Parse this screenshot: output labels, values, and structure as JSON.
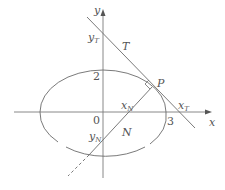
{
  "diagram": {
    "type": "ellipse-tangent-normal",
    "axes": {
      "x_label": "x",
      "y_label": "y"
    },
    "ticks": {
      "origin": "0",
      "x_intercept": "3",
      "y_intercept": "2"
    },
    "points": {
      "P": "P"
    },
    "lines": {
      "tangent": "T",
      "normal": "N"
    },
    "intercepts": {
      "tangent_y": {
        "base": "y",
        "sub": "T"
      },
      "tangent_x": {
        "base": "x",
        "sub": "T"
      },
      "normal_x": {
        "base": "x",
        "sub": "N"
      },
      "normal_y": {
        "base": "y",
        "sub": "N"
      }
    },
    "colors": {
      "stroke": "#6b6b6b",
      "axis": "#7a7a7a",
      "text": "#555555"
    }
  }
}
